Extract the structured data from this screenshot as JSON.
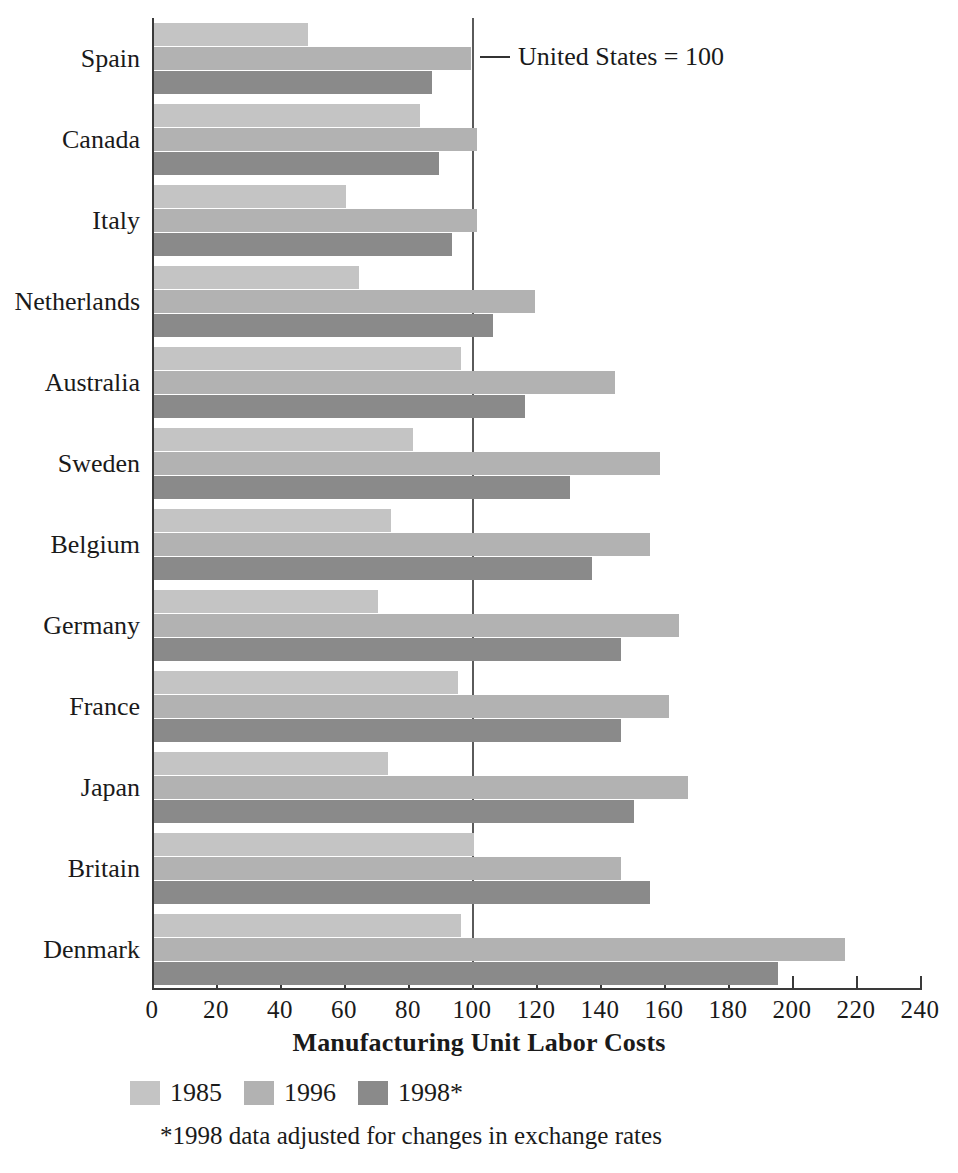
{
  "chart_data": {
    "type": "bar",
    "orientation": "horizontal",
    "title": "",
    "xlabel": "Manufacturing Unit Labor Costs",
    "ylabel": "",
    "xlim": [
      0,
      240
    ],
    "xticks": [
      0,
      20,
      40,
      60,
      80,
      100,
      120,
      140,
      160,
      180,
      200,
      220,
      240
    ],
    "grid": false,
    "legend_position": "bottom-left",
    "categories": [
      "Spain",
      "Canada",
      "Italy",
      "Netherlands",
      "Australia",
      "Sweden",
      "Belgium",
      "Germany",
      "France",
      "Japan",
      "Britain",
      "Denmark"
    ],
    "series": [
      {
        "name": "1985",
        "color": "#c4c4c4",
        "values": [
          48,
          83,
          60,
          64,
          96,
          81,
          74,
          70,
          95,
          73,
          100,
          96
        ]
      },
      {
        "name": "1996",
        "color": "#b2b2b2",
        "values": [
          99,
          101,
          101,
          119,
          144,
          158,
          155,
          164,
          161,
          167,
          146,
          216
        ]
      },
      {
        "name": "1998*",
        "color": "#8a8a8a",
        "values": [
          87,
          89,
          93,
          106,
          116,
          130,
          137,
          146,
          146,
          150,
          155,
          195
        ]
      }
    ],
    "annotations": [
      {
        "text": "United States = 100",
        "value": 100,
        "marker": "line"
      }
    ],
    "footnote": "*1998 data adjusted for changes in exchange rates"
  },
  "reference": {
    "label": "United States = 100",
    "value": 100
  },
  "axis": {
    "title": "Manufacturing Unit Labor Costs",
    "tick_labels": [
      "0",
      "20",
      "40",
      "60",
      "80",
      "100",
      "120",
      "140",
      "160",
      "180",
      "200",
      "220",
      "240"
    ]
  },
  "legend": {
    "items": [
      {
        "label": "1985",
        "color": "#c4c4c4"
      },
      {
        "label": "1996",
        "color": "#b2b2b2"
      },
      {
        "label": "1998*",
        "color": "#8a8a8a"
      }
    ]
  },
  "footnote": {
    "text": "*1998 data adjusted for changes in exchange rates"
  }
}
